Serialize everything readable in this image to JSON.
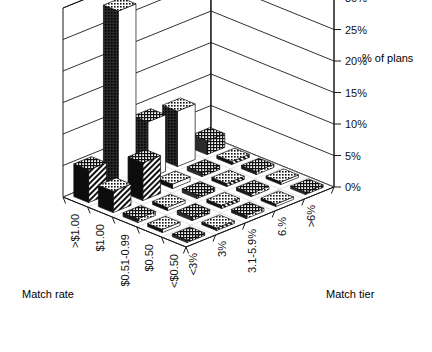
{
  "chart_data": {
    "type": "bar",
    "title": "",
    "subtitle": "",
    "render": "3d-bar",
    "xlabel": "Match rate",
    "ylabel": "Match tier",
    "zlabel": "% of plans",
    "legend": "none",
    "grid": true,
    "zlim": [
      0,
      30
    ],
    "ztick_labels": [
      "0%",
      "5%",
      "10%",
      "15%",
      "20%",
      "25%",
      "30%"
    ],
    "ztick_values": [
      0,
      5,
      10,
      15,
      20,
      25,
      30
    ],
    "categories_x": [
      "<$0.50",
      "$0.50",
      "$0.51-0.99",
      "$1.00",
      ">$1.00"
    ],
    "categories_y": [
      "<3%",
      "3%",
      "3.1-5.9%",
      "6.%",
      ">6%"
    ],
    "series": [
      {
        "name": "<3%",
        "values": [
          0.4,
          0.5,
          0.6,
          3.4,
          5.2
        ]
      },
      {
        "name": "3%",
        "values": [
          0.4,
          0.6,
          0.5,
          6.0,
          28.5
        ]
      },
      {
        "name": "3.1-5.9%",
        "values": [
          0.5,
          0.5,
          0.6,
          0.7,
          9.0
        ]
      },
      {
        "name": "6.%",
        "values": [
          0.4,
          0.5,
          0.5,
          0.6,
          8.8
        ]
      },
      {
        "name": ">6%",
        "values": [
          0.4,
          0.4,
          0.5,
          0.5,
          2.2
        ]
      }
    ]
  },
  "labels": {
    "x_axis_title": "Match rate",
    "y_axis_title": "Match tier",
    "z_axis_title": "% of plans",
    "x_categories": [
      "<$0.50",
      "$0.50",
      "$0.51-0.99",
      "$1.00",
      ">$1.00"
    ],
    "y_categories": [
      "<3%",
      "3%",
      "3.1-5.9%",
      "6.%",
      ">6%"
    ],
    "z_ticks": [
      "0%",
      "5%",
      "10%",
      "15%",
      "20%",
      "25%",
      "30%"
    ]
  },
  "colors": {
    "background": "#ffffff",
    "line": "#1a1a1a",
    "bar_dark": "#0d0d0d",
    "bar_light": "#ffffff",
    "bar_mid": "#555555",
    "text": "#000000"
  }
}
